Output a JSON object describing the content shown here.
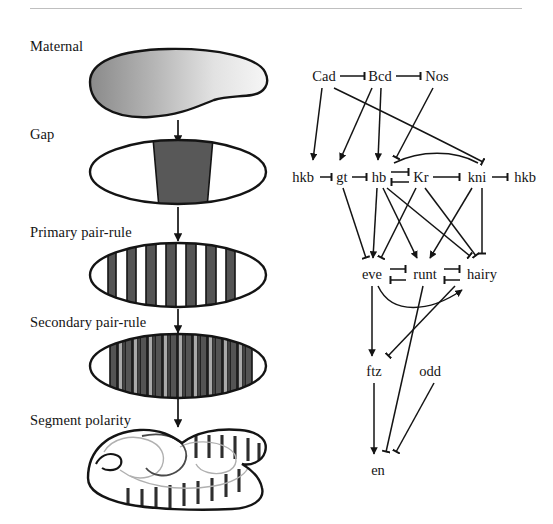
{
  "figure": {
    "divider_color": "#bfbfbf",
    "background_color": "#ffffff",
    "ink_color": "#141414"
  },
  "stages": [
    {
      "id": "maternal",
      "label": "Maternal",
      "label_x": 30,
      "label_y": 45
    },
    {
      "id": "gap",
      "label": "Gap",
      "label_x": 30,
      "label_y": 133
    },
    {
      "id": "primary-pair-rule",
      "label": "Primary pair-rule",
      "label_x": 30,
      "label_y": 231
    },
    {
      "id": "secondary-pair-rule",
      "label": "Secondary pair-rule",
      "label_x": 30,
      "label_y": 321
    },
    {
      "id": "segment-polarity",
      "label": "Segment polarity",
      "label_x": 30,
      "label_y": 419
    }
  ],
  "embryos": [
    {
      "id": "maternal-embryo",
      "stage": "maternal",
      "cx": 178,
      "cy": 84,
      "rx": 88,
      "ry": 34,
      "fill": "gradient-gray"
    },
    {
      "id": "gap-embryo",
      "stage": "gap",
      "cx": 178,
      "cy": 172,
      "rx": 88,
      "ry": 32,
      "fill": "single-broad-band"
    },
    {
      "id": "primary-pair-rule-embryo",
      "stage": "primary-pair-rule",
      "cx": 178,
      "cy": 275,
      "rx": 88,
      "ry": 32,
      "fill": "seven-dark-stripes"
    },
    {
      "id": "secondary-pair-rule-embryo",
      "stage": "secondary-pair-rule",
      "cx": 178,
      "cy": 366,
      "rx": 88,
      "ry": 32,
      "fill": "fourteen-alternating-stripes"
    },
    {
      "id": "segment-polarity-embryo",
      "stage": "segment-polarity",
      "cx": 178,
      "cy": 470,
      "rx": 92,
      "ry": 40,
      "fill": "germ-band-extended"
    }
  ],
  "stage_arrows": [
    {
      "id": "arrow-maternal-to-gap",
      "x": 178,
      "y1": 122,
      "y2": 140
    },
    {
      "id": "arrow-gap-to-primary",
      "x": 178,
      "y1": 208,
      "y2": 243
    },
    {
      "id": "arrow-primary-to-secondary",
      "x": 178,
      "y1": 310,
      "y2": 334
    },
    {
      "id": "arrow-secondary-to-polarity",
      "x": 178,
      "y1": 400,
      "y2": 428
    }
  ],
  "stripe_counts": {
    "primary_pair_rule": 7,
    "secondary_pair_rule": 14,
    "segment_polarity": 15
  },
  "colors": {
    "dark_stripe": "#545454",
    "light_stripe": "#a9a9a9",
    "gap_band": "#585858",
    "embryo_outline": "#141414",
    "gradient_from": "#8a8a8a",
    "gradient_to": "#f2f2f2"
  },
  "network": {
    "title": "Segmentation gene regulatory network",
    "rows": {
      "maternal": {
        "y": 76,
        "genes": [
          {
            "id": "cad",
            "label": "Cad",
            "x": 324
          },
          {
            "id": "bcd",
            "label": "Bcd",
            "x": 380
          },
          {
            "id": "nos",
            "label": "Nos",
            "x": 437
          }
        ]
      },
      "gap": {
        "y": 177,
        "genes": [
          {
            "id": "hkb-left",
            "label": "hkb",
            "x": 303
          },
          {
            "id": "gt",
            "label": "gt",
            "x": 342
          },
          {
            "id": "hb",
            "label": "hb",
            "x": 379
          },
          {
            "id": "kr",
            "label": "Kr",
            "x": 421
          },
          {
            "id": "kni",
            "label": "kni",
            "x": 477
          },
          {
            "id": "hkb-right",
            "label": "hkb",
            "x": 525
          }
        ]
      },
      "pair_rule": {
        "y": 274,
        "genes": [
          {
            "id": "eve",
            "label": "eve",
            "x": 372
          },
          {
            "id": "runt",
            "label": "runt",
            "x": 425
          },
          {
            "id": "hairy",
            "label": "hairy",
            "x": 482
          }
        ]
      },
      "secondary": {
        "y": 371,
        "genes": [
          {
            "id": "ftz",
            "label": "ftz",
            "x": 374
          },
          {
            "id": "odd",
            "label": "odd",
            "x": 430
          }
        ]
      },
      "polarity": {
        "y": 470,
        "genes": [
          {
            "id": "en",
            "label": "en",
            "x": 378
          }
        ]
      }
    },
    "interaction_types": {
      "activation": "arrow",
      "repression": "t-bar"
    },
    "edges": [
      {
        "from": "cad",
        "to": "bcd",
        "type": "repression"
      },
      {
        "from": "bcd",
        "to": "nos",
        "type": "repression"
      },
      {
        "from": "hkb-left",
        "to": "gt",
        "type": "repression"
      },
      {
        "from": "gt",
        "to": "hb",
        "type": "repression"
      },
      {
        "from": "hb",
        "to": "kr",
        "type": "repression"
      },
      {
        "from": "kr",
        "to": "hb",
        "type": "repression"
      },
      {
        "from": "kr",
        "to": "kni",
        "type": "repression"
      },
      {
        "from": "kni",
        "to": "hkb-right",
        "type": "repression"
      },
      {
        "from": "cad",
        "to": "hkb-left",
        "type": "activation"
      },
      {
        "from": "cad",
        "to": "kni",
        "type": "repression"
      },
      {
        "from": "bcd",
        "to": "gt",
        "type": "activation"
      },
      {
        "from": "bcd",
        "to": "hb",
        "type": "activation"
      },
      {
        "from": "nos",
        "to": "hb",
        "type": "repression"
      },
      {
        "from": "gt",
        "to": "eve",
        "type": "repression"
      },
      {
        "from": "hb",
        "to": "eve",
        "type": "activation"
      },
      {
        "from": "hb",
        "to": "runt",
        "type": "activation"
      },
      {
        "from": "hb",
        "to": "hairy",
        "type": "repression"
      },
      {
        "from": "kr",
        "to": "eve",
        "type": "repression"
      },
      {
        "from": "kr",
        "to": "hairy",
        "type": "repression"
      },
      {
        "from": "kni",
        "to": "runt",
        "type": "activation"
      },
      {
        "from": "kni",
        "to": "hairy",
        "type": "repression"
      },
      {
        "from": "eve",
        "to": "runt",
        "type": "repression"
      },
      {
        "from": "runt",
        "to": "eve",
        "type": "repression"
      },
      {
        "from": "runt",
        "to": "hairy",
        "type": "repression"
      },
      {
        "from": "hairy",
        "to": "runt",
        "type": "repression"
      },
      {
        "from": "eve",
        "to": "ftz",
        "type": "activation"
      },
      {
        "from": "hairy",
        "to": "ftz",
        "type": "repression"
      },
      {
        "from": "eve",
        "to": "hairy",
        "type": "activation"
      },
      {
        "from": "ftz",
        "to": "en",
        "type": "activation"
      },
      {
        "from": "runt",
        "to": "en",
        "type": "repression"
      },
      {
        "from": "odd",
        "to": "en",
        "type": "repression"
      }
    ]
  }
}
